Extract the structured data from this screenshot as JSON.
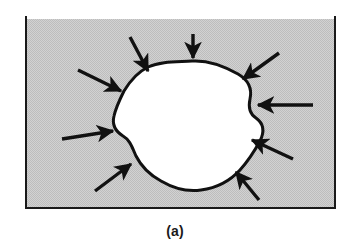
{
  "figure": {
    "caption": "(a)",
    "frame": {
      "x": 25,
      "y": 19,
      "width": 311,
      "height": 190,
      "fill_color": "#c9c9c9",
      "border_color": "#1a1a1a",
      "border_width": 2
    },
    "inclusion": {
      "label": "inclusion",
      "fill_color": "#ffffff",
      "outline_color": "#111111",
      "outline_width": 3,
      "path": "M 192 61 C 208 60 224 66 238 74 C 250 81 252 90 250 99 C 248 108 250 114 256 118 C 263 123 265 131 260 141 C 254 152 248 161 240 170 C 230 181 216 188 201 190 C 187 192 173 188 161 181 C 150 175 141 166 136 156 C 132 147 130 140 123 136 C 115 131 112 124 114 116 C 116 107 120 99 124 91 C 130 81 138 72 148 67 C 161 61 177 62 192 61 Z"
    },
    "arrows": [
      {
        "name": "arrow-top",
        "x1": 193,
        "y1": 34,
        "x2": 193,
        "y2": 58,
        "direction": "down"
      },
      {
        "name": "arrow-top-left",
        "x1": 130,
        "y1": 37,
        "x2": 148,
        "y2": 71,
        "direction": "down-right"
      },
      {
        "name": "arrow-upper-left",
        "x1": 78,
        "y1": 70,
        "x2": 121,
        "y2": 91,
        "direction": "down-right"
      },
      {
        "name": "arrow-left",
        "x1": 62,
        "y1": 139,
        "x2": 113,
        "y2": 131,
        "direction": "right"
      },
      {
        "name": "arrow-lower-left",
        "x1": 95,
        "y1": 191,
        "x2": 131,
        "y2": 164,
        "direction": "up-right"
      },
      {
        "name": "arrow-top-right",
        "x1": 279,
        "y1": 53,
        "x2": 243,
        "y2": 79,
        "direction": "down-left"
      },
      {
        "name": "arrow-right",
        "x1": 313,
        "y1": 105,
        "x2": 258,
        "y2": 105,
        "direction": "left"
      },
      {
        "name": "arrow-lower-right",
        "x1": 293,
        "y1": 159,
        "x2": 252,
        "y2": 140,
        "direction": "up-left"
      },
      {
        "name": "arrow-bottom-right",
        "x1": 259,
        "y1": 200,
        "x2": 236,
        "y2": 172,
        "direction": "up-left"
      }
    ],
    "caption_position": {
      "x": 175,
      "y": 236
    }
  }
}
